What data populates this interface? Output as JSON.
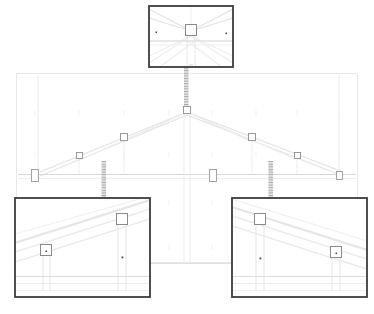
{
  "document": {
    "type": "cad-elevation-drawing",
    "subject": "roof truss elevation with detail callouts",
    "background_color": "#ffffff",
    "line_color_faint": "#e3e3e3",
    "line_color_light": "#d6d6d6",
    "line_color_mid": "#b9b9b9",
    "marker_stroke": "#8a8a8a",
    "callout_border_color": "#3c3c3c",
    "leader_color": "#b0b0b0",
    "viewport": {
      "width": 374,
      "height": 314
    }
  },
  "main_view": {
    "name": "main-elevation-view",
    "frame": {
      "x": 16,
      "y": 73,
      "width": 342,
      "height": 190
    },
    "border_color": "#e6e6e6",
    "bottom_chord_y": 174,
    "ridge_apex": {
      "x": 187,
      "y": 110
    },
    "ground_line_y": 263,
    "plate_markers": [
      {
        "id": "plate-left-end",
        "x": 35,
        "y": 176,
        "w": 7,
        "h": 12,
        "shape": "rect"
      },
      {
        "id": "plate-center",
        "x": 212,
        "y": 176,
        "w": 7,
        "h": 12,
        "shape": "rect"
      },
      {
        "id": "plate-right-end",
        "x": 339,
        "y": 176,
        "w": 6,
        "h": 8,
        "shape": "rect"
      }
    ],
    "node_markers": [
      {
        "id": "node-apex",
        "x": 187,
        "y": 110,
        "w": 7,
        "h": 7,
        "shape": "square"
      },
      {
        "id": "node-left-upper",
        "x": 124,
        "y": 137,
        "w": 7,
        "h": 7,
        "shape": "square"
      },
      {
        "id": "node-left-lower",
        "x": 79,
        "y": 155,
        "w": 6,
        "h": 6,
        "shape": "square"
      },
      {
        "id": "node-right-upper",
        "x": 252,
        "y": 137,
        "w": 7,
        "h": 7,
        "shape": "square"
      },
      {
        "id": "node-right-lower",
        "x": 297,
        "y": 155,
        "w": 6,
        "h": 6,
        "shape": "square"
      }
    ],
    "grid_tick_columns": [
      35,
      79,
      124,
      169,
      212,
      256,
      297,
      339
    ],
    "grid_tick_rows": [
      113,
      155,
      203,
      247
    ]
  },
  "callouts": [
    {
      "id": "detail-top",
      "label": "top-detail-callout",
      "frame": {
        "x": 148,
        "y": 5,
        "width": 86,
        "height": 63
      },
      "target": {
        "x": 187,
        "y": 110
      },
      "leader": {
        "x": 187,
        "y1": 68,
        "y2": 107,
        "style": "hatched"
      },
      "content": "ridge apex node with tie plate"
    },
    {
      "id": "detail-bottom-left",
      "label": "bottom-left-detail-callout",
      "frame": {
        "x": 14,
        "y": 197,
        "width": 137,
        "height": 101
      },
      "target": {
        "x": 104,
        "y": 160
      },
      "leader": {
        "x": 104,
        "y1": 162,
        "y2": 197,
        "style": "hatched"
      },
      "content": "left web-to-chord connection nodes"
    },
    {
      "id": "detail-bottom-right",
      "label": "bottom-right-detail-callout",
      "frame": {
        "x": 231,
        "y": 197,
        "width": 137,
        "height": 101
      },
      "target": {
        "x": 271,
        "y": 160
      },
      "leader": {
        "x": 271,
        "y1": 162,
        "y2": 197,
        "style": "hatched"
      },
      "content": "right web-to-chord connection nodes"
    }
  ],
  "detail_top_view": {
    "name": "detail-top-content",
    "center_node": {
      "x": 191,
      "y": 30,
      "w": 11,
      "h": 11
    },
    "dot_markers": [
      {
        "x": 156,
        "y": 32
      },
      {
        "x": 226,
        "y": 33
      }
    ],
    "vertical_post_x": 191,
    "sloped_members": 4
  },
  "detail_bottom_left_view": {
    "name": "detail-bottom-left-content",
    "nodes": [
      {
        "id": "bl-node-low",
        "x": 46,
        "y": 250,
        "w": 11,
        "h": 11
      },
      {
        "id": "bl-node-high",
        "x": 121,
        "y": 219,
        "w": 11,
        "h": 11
      }
    ],
    "dot_markers": [
      {
        "x": 122,
        "y": 257
      }
    ],
    "slab_line_y": 277,
    "slope_direction": "up-to-the-right"
  },
  "detail_bottom_right_view": {
    "name": "detail-bottom-right-content",
    "nodes": [
      {
        "id": "br-node-high",
        "x": 260,
        "y": 219,
        "w": 11,
        "h": 11
      },
      {
        "id": "br-node-low",
        "x": 336,
        "y": 252,
        "w": 11,
        "h": 11
      }
    ],
    "dot_markers": [
      {
        "x": 260,
        "y": 258
      }
    ],
    "slab_line_y": 277,
    "slope_direction": "down-to-the-right"
  }
}
